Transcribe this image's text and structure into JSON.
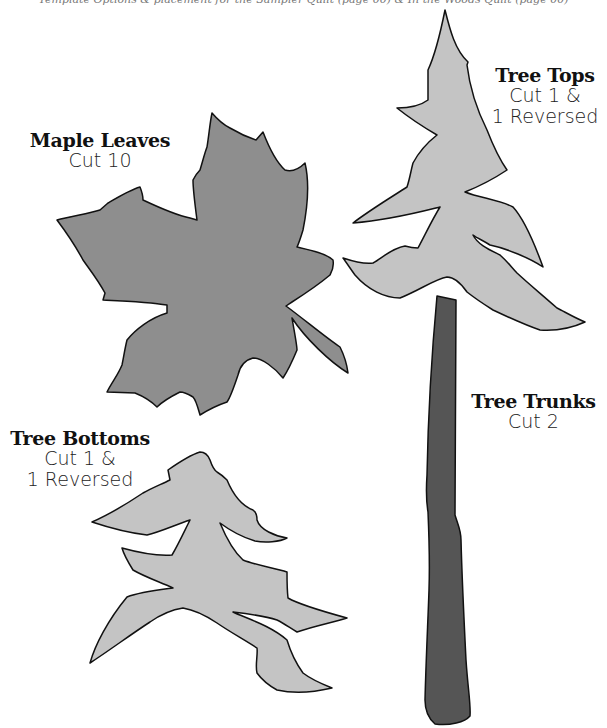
{
  "header": {
    "text": "Template Options & placement for the Sampler Quilt (page 00) & In the Woods Quilt (page 00)"
  },
  "colors": {
    "maple_leaf_fill": "#8e8e8e",
    "tree_fill": "#c4c4c4",
    "trunk_fill": "#555555",
    "outline": "#111111"
  },
  "templates": [
    {
      "id": "maple",
      "title": "Maple Leaves",
      "lines": [
        "Cut 10"
      ]
    },
    {
      "id": "tops",
      "title": "Tree Tops",
      "lines": [
        "Cut 1 &",
        "1 Reversed"
      ]
    },
    {
      "id": "trunks",
      "title": "Tree Trunks",
      "lines": [
        "Cut 2"
      ]
    },
    {
      "id": "bottoms",
      "title": "Tree Bottoms",
      "lines": [
        "Cut 1 &",
        "1 Reversed"
      ]
    }
  ]
}
